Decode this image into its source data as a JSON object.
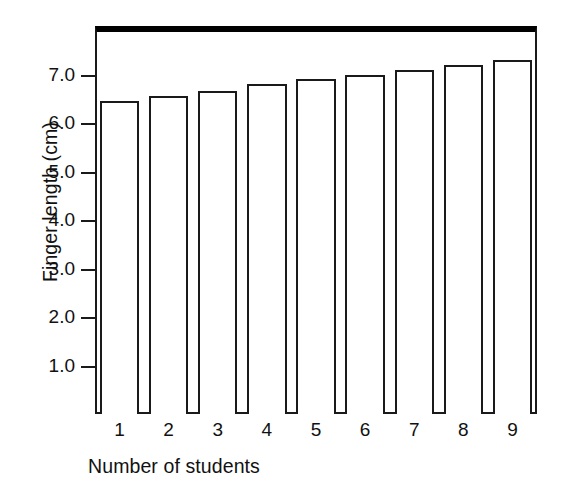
{
  "chart_data": {
    "type": "bar",
    "title": "",
    "xlabel": "Number of students",
    "ylabel": "Finger length (cm)",
    "categories": [
      "1",
      "2",
      "3",
      "4",
      "5",
      "6",
      "7",
      "8",
      "9"
    ],
    "values": [
      6.45,
      6.55,
      6.65,
      6.8,
      6.9,
      7.0,
      7.1,
      7.2,
      7.3
    ],
    "ylim": [
      0.0,
      8.0
    ],
    "ytick_labels": [
      "1.0",
      "2.0",
      "3.0",
      "4.0",
      "5.0",
      "6.0",
      "7.0"
    ],
    "ytick_values": [
      1.0,
      2.0,
      3.0,
      4.0,
      5.0,
      6.0,
      7.0
    ],
    "grid": false,
    "legend": null,
    "bar_fill_color": "#ffffff",
    "bar_edge_color": "#1a1a1a",
    "axis_color": "#1a1a1a",
    "background_color": "#ffffff"
  }
}
